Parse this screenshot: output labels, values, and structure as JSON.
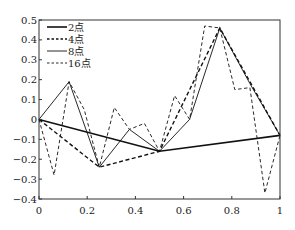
{
  "chart_data": {
    "type": "line",
    "title": "",
    "xlabel": "",
    "ylabel": "",
    "xlim": [
      0,
      1
    ],
    "ylim": [
      -0.4,
      0.5
    ],
    "grid": false,
    "legend_position": "upper left",
    "x_ticks": [
      {
        "value": 0,
        "label": "0"
      },
      {
        "value": 0.2,
        "label": "0.2"
      },
      {
        "value": 0.4,
        "label": "0.4"
      },
      {
        "value": 0.6,
        "label": "0.6"
      },
      {
        "value": 0.8,
        "label": "0.8"
      },
      {
        "value": 1,
        "label": "1"
      }
    ],
    "y_ticks": [
      {
        "value": 0.5,
        "label": "0.5"
      },
      {
        "value": 0.4,
        "label": "0.4"
      },
      {
        "value": 0.3,
        "label": "0.3"
      },
      {
        "value": 0.2,
        "label": "0.2"
      },
      {
        "value": 0.1,
        "label": "0.1"
      },
      {
        "value": 0,
        "label": "0"
      },
      {
        "value": -0.1,
        "label": "−0.1"
      },
      {
        "value": -0.2,
        "label": "−0.2"
      },
      {
        "value": -0.3,
        "label": "−0.3"
      },
      {
        "value": -0.4,
        "label": "−0.4"
      }
    ],
    "series": [
      {
        "name": "2点",
        "style": "solid-thick",
        "x": [
          0,
          0.5,
          1
        ],
        "values": [
          0,
          -0.16,
          -0.08
        ]
      },
      {
        "name": "4点",
        "style": "dashed-thick",
        "x": [
          0,
          0.25,
          0.5,
          0.75,
          1
        ],
        "values": [
          0,
          -0.24,
          -0.16,
          0.46,
          -0.08
        ]
      },
      {
        "name": "8点",
        "style": "solid-thin",
        "x": [
          0,
          0.125,
          0.25,
          0.375,
          0.5,
          0.625,
          0.75,
          0.875,
          1
        ],
        "values": [
          0,
          0.19,
          -0.24,
          -0.05,
          -0.16,
          0.0,
          0.46,
          0.18,
          -0.08
        ]
      },
      {
        "name": "16点",
        "style": "dashed-thin",
        "x": [
          0,
          0.0625,
          0.125,
          0.1875,
          0.25,
          0.3125,
          0.375,
          0.4375,
          0.5,
          0.5625,
          0.625,
          0.6875,
          0.75,
          0.8125,
          0.875,
          0.9375,
          1
        ],
        "values": [
          0,
          -0.28,
          0.19,
          0.05,
          -0.24,
          0.06,
          -0.05,
          -0.02,
          -0.16,
          0.12,
          0.0,
          0.47,
          0.46,
          0.15,
          0.16,
          -0.37,
          -0.08
        ]
      }
    ]
  },
  "colors": {
    "line": "#111111",
    "axis": "#333333",
    "background": "#ffffff"
  }
}
